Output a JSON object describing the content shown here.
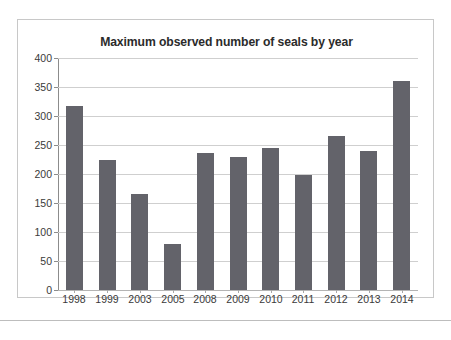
{
  "figure": {
    "background_color": "#ffffff",
    "frame_color": "#c8c8c8",
    "separator_color": "#bdbdbd"
  },
  "chart_data": {
    "type": "bar",
    "title": "Maximum observed number of seals by year",
    "xlabel": "",
    "ylabel": "",
    "categories": [
      "1998",
      "1999",
      "2003",
      "2005",
      "2008",
      "2009",
      "2010",
      "2011",
      "2012",
      "2013",
      "2014"
    ],
    "values": [
      318,
      224,
      165,
      80,
      237,
      230,
      245,
      198,
      265,
      240,
      360
    ],
    "ylim": [
      0,
      400
    ],
    "ytick_labels": [
      "0",
      "50",
      "100",
      "150",
      "200",
      "250",
      "300",
      "350",
      "400"
    ],
    "ytick_values": [
      0,
      50,
      100,
      150,
      200,
      250,
      300,
      350,
      400
    ],
    "grid": true,
    "grid_axis": "y",
    "grid_color": "#cfcfcf",
    "legend": false,
    "legend_position": "none",
    "bar_color": "#63636a",
    "axis_color": "#8c8c8c",
    "title_color": "#2b2b2b",
    "tick_label_color": "#3a3a3a"
  }
}
